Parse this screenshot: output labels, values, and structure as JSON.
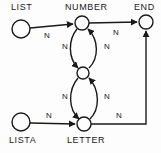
{
  "diagram": {
    "type": "state-transition-graph",
    "title": "",
    "colors": {
      "stroke": "#1a1a1a",
      "background": "#fdfdfd",
      "text": "#1a1a1a"
    },
    "nodes": [
      {
        "id": "list",
        "label": "LIST",
        "label_position": "above",
        "shape": "circle",
        "cx": 21,
        "cy": 29,
        "r": 9
      },
      {
        "id": "number",
        "label": "NUMBER",
        "label_position": "above",
        "shape": "circle",
        "cx": 82,
        "cy": 23,
        "r": 7
      },
      {
        "id": "end",
        "label": "END",
        "label_position": "above",
        "shape": "circle",
        "cx": 146,
        "cy": 22,
        "r": 7
      },
      {
        "id": "middle",
        "label": "",
        "label_position": "none",
        "shape": "circle",
        "cx": 83,
        "cy": 73,
        "r": 6
      },
      {
        "id": "lista",
        "label": "LISTA",
        "label_position": "below",
        "shape": "circle",
        "cx": 21,
        "cy": 122,
        "r": 9
      },
      {
        "id": "letter",
        "label": "LETTER",
        "label_position": "below",
        "shape": "circle",
        "cx": 84,
        "cy": 124,
        "r": 7
      }
    ],
    "edges": [
      {
        "id": "list-number",
        "from": "list",
        "to": "number",
        "label": "N",
        "style": "straight"
      },
      {
        "id": "number-end",
        "from": "number",
        "to": "end",
        "label": "N",
        "style": "straight"
      },
      {
        "id": "number-middle",
        "from": "number",
        "to": "middle",
        "label": "N",
        "style": "curve-left"
      },
      {
        "id": "middle-number",
        "from": "middle",
        "to": "number",
        "label": "N",
        "style": "curve-right"
      },
      {
        "id": "middle-letter",
        "from": "middle",
        "to": "letter",
        "label": "N",
        "style": "curve-left"
      },
      {
        "id": "letter-middle",
        "from": "letter",
        "to": "middle",
        "label": "N",
        "style": "curve-right"
      },
      {
        "id": "lista-letter",
        "from": "lista",
        "to": "letter",
        "label": "N",
        "style": "straight"
      },
      {
        "id": "letter-end",
        "from": "letter",
        "to": "end",
        "label": "N",
        "style": "orthogonal"
      }
    ],
    "edge_labels": {
      "list_number": "N",
      "number_end": "N",
      "upper_loop_left": "N",
      "upper_loop_right": "N",
      "lower_loop_left": "N",
      "lower_loop_right": "N",
      "lista_letter": "N",
      "letter_end": "N"
    },
    "node_labels": {
      "list": "LIST",
      "number": "NUMBER",
      "end": "END",
      "lista": "LISTA",
      "letter": "LETTER"
    }
  }
}
